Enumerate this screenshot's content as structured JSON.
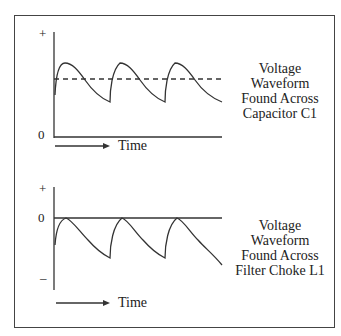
{
  "diagrams": [
    {
      "id": "capacitor",
      "caption_lines": [
        "Voltage",
        "Waveform",
        "Found Across",
        "Capacitor C1"
      ],
      "y_labels": {
        "plus": "+",
        "zero": "0"
      },
      "x_label": "Time",
      "waveform": "positive ripple above zero with dashed average line",
      "cycles": 3
    },
    {
      "id": "choke",
      "caption_lines": [
        "Voltage",
        "Waveform",
        "Found Across",
        "Filter Choke L1"
      ],
      "y_labels": {
        "plus": "+",
        "zero": "0",
        "minus": "–"
      },
      "x_label": "Time",
      "waveform": "negative-going ripple touching zero line",
      "cycles": 3
    }
  ],
  "colors": {
    "line": "#333333",
    "border": "#444444",
    "background": "#ffffff"
  }
}
